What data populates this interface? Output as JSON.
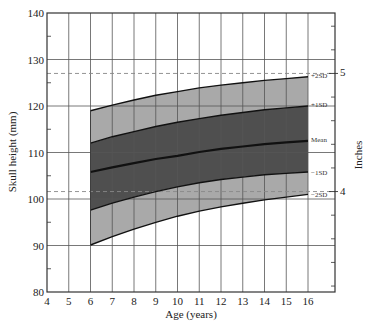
{
  "chart_data": {
    "type": "area",
    "title": "",
    "xlabel": "Age (years)",
    "ylabel": "Skull height (mm)",
    "y2label": "Inches",
    "xlim": [
      4,
      17.2
    ],
    "ylim": [
      80,
      140
    ],
    "xticks": [
      4,
      5,
      6,
      7,
      8,
      9,
      10,
      11,
      12,
      13,
      14,
      15,
      16
    ],
    "yticks": [
      80,
      90,
      100,
      110,
      120,
      130,
      140
    ],
    "y_minor_ticks": [
      85,
      95,
      105,
      115,
      125,
      135
    ],
    "y2ticks": [
      {
        "label": "4",
        "mm": 101.6
      },
      {
        "label": "5",
        "mm": 127
      }
    ],
    "y2_minor_ticks_mm": [
      81.28,
      86.36,
      91.44,
      96.52,
      106.68,
      111.76,
      116.84,
      121.92,
      132.08,
      137.16
    ],
    "grid": true,
    "reference_lines": [
      {
        "label": "5 inches",
        "y": 127,
        "style": "dashed"
      },
      {
        "label": "4 inches",
        "y": 101.6,
        "style": "dashed"
      }
    ],
    "x": [
      6,
      7,
      8,
      9,
      10,
      11,
      12,
      13,
      14,
      15,
      16
    ],
    "series": [
      {
        "name": "+2SD",
        "values": [
          119.0,
          120.2,
          121.3,
          122.3,
          123.1,
          123.9,
          124.5,
          125.0,
          125.5,
          125.9,
          126.3
        ]
      },
      {
        "name": "+1SD",
        "values": [
          112.0,
          113.4,
          114.5,
          115.6,
          116.5,
          117.3,
          118.0,
          118.6,
          119.2,
          119.6,
          120.0
        ]
      },
      {
        "name": "Mean",
        "values": [
          105.8,
          106.8,
          107.7,
          108.6,
          109.3,
          110.1,
          110.8,
          111.3,
          111.8,
          112.2,
          112.5
        ]
      },
      {
        "name": "-1SD",
        "values": [
          97.6,
          99.1,
          100.4,
          101.6,
          102.6,
          103.5,
          104.2,
          104.7,
          105.2,
          105.5,
          105.8
        ]
      },
      {
        "name": "-2SD",
        "values": [
          90.1,
          91.9,
          93.5,
          95.0,
          96.3,
          97.4,
          98.3,
          99.1,
          99.8,
          100.4,
          101.0
        ]
      }
    ],
    "bands": [
      {
        "from": "+1SD",
        "to": "+2SD",
        "color": "#a9a9a9"
      },
      {
        "from": "-1SD",
        "to": "+1SD",
        "color": "#4f4f4f"
      },
      {
        "from": "-2SD",
        "to": "-1SD",
        "color": "#a9a9a9"
      }
    ],
    "series_labels": [
      "+2SD",
      "+1SD",
      "Mean",
      "−1SD",
      "−2SD"
    ]
  }
}
